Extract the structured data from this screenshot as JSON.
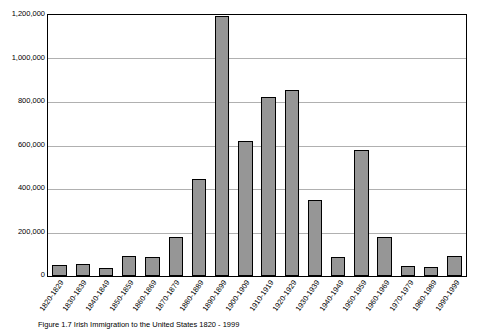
{
  "chart_data": {
    "type": "bar",
    "title": "",
    "xlabel": "",
    "ylabel": "",
    "ylim": [
      0,
      1200000
    ],
    "grid": true,
    "legend": "none",
    "categories": [
      "1820-1829",
      "1830-1839",
      "1840-1849",
      "1850-1859",
      "1860-1869",
      "1870-1879",
      "1880-1889",
      "1890-1899",
      "1900-1909",
      "1910-1919",
      "1920-1929",
      "1930-1939",
      "1940-1949",
      "1950-1959",
      "1960-1969",
      "1970-1979",
      "1980-1989",
      "1990-1999"
    ],
    "values": [
      50000,
      55000,
      35000,
      90000,
      88000,
      180000,
      445000,
      1195000,
      620000,
      825000,
      855000,
      350000,
      88000,
      580000,
      180000,
      45000,
      42000,
      90000
    ],
    "ytick_labels": [
      "1,200,000",
      "1,000,000",
      "800,000",
      "600,000",
      "400,000",
      "200,000",
      "0"
    ],
    "ytick_values": [
      1200000,
      1000000,
      800000,
      600000,
      400000,
      200000,
      0
    ],
    "bar_fill_color": "#969696",
    "bar_border_color": "#000000",
    "grid_color": "#b0b0b0",
    "axis_color": "#000000"
  },
  "caption": {
    "text": "Figure 1.7  Irish Immigration to the United States 1820 - 1999"
  }
}
